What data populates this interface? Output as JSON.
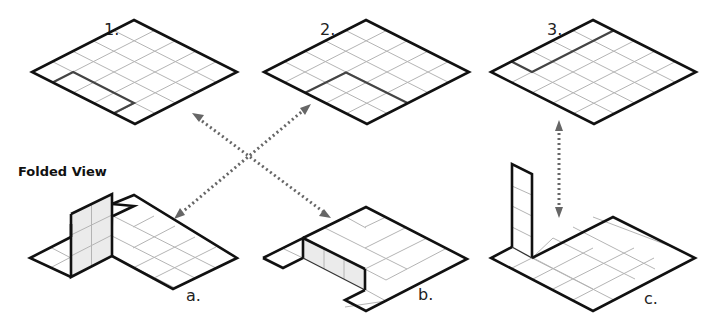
{
  "title": "Folded View",
  "flat_nets": [
    {
      "label": "1.",
      "highlight": "3x1 strip along lower-left edge"
    },
    {
      "label": "2.",
      "highlight": "3x2 block at bottom corner"
    },
    {
      "label": "3.",
      "highlight": "1x4 strip along upper-left edge"
    }
  ],
  "folded_views": [
    {
      "label": "a.",
      "description": "2x3 panel folded upright"
    },
    {
      "label": "b.",
      "description": "3x1 strip folded down as wall"
    },
    {
      "label": "c.",
      "description": "1x4 strip folded upright as tall column"
    }
  ],
  "connections": [
    {
      "from": "1.",
      "to": "b."
    },
    {
      "from": "2.",
      "to": "a."
    },
    {
      "from": "3.",
      "to": "c."
    }
  ],
  "colors": {
    "edge": "#111111",
    "grid": "#b4b4b4",
    "arrow": "#666666",
    "wall_fill": "#ebebeb"
  }
}
